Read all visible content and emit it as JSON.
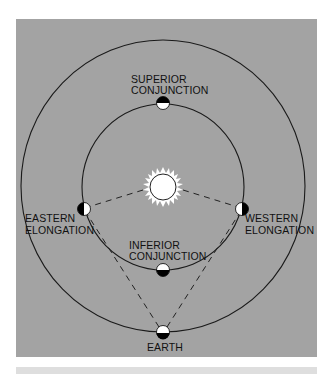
{
  "diagram": {
    "colors": {
      "panel": "#a3a3a3",
      "footer_band": "#dedede",
      "orbit": "#1a1a1a",
      "sun": "#ffffff",
      "planet_dark": "#000000",
      "planet_light": "#ffffff"
    },
    "labels": {
      "superior_line1": "SUPERIOR",
      "superior_line2": "CONJUNCTION",
      "eastern_line1": "EASTERN",
      "eastern_line2": "ELONGATION",
      "western_line1": "WESTERN",
      "western_line2": "ELONGATION",
      "inferior_line1": "INFERIOR",
      "inferior_line2": "CONJUNCTION",
      "earth": "EARTH"
    },
    "icons": {
      "sun": "sun-icon",
      "planet": "half-lit-planet-icon"
    }
  }
}
